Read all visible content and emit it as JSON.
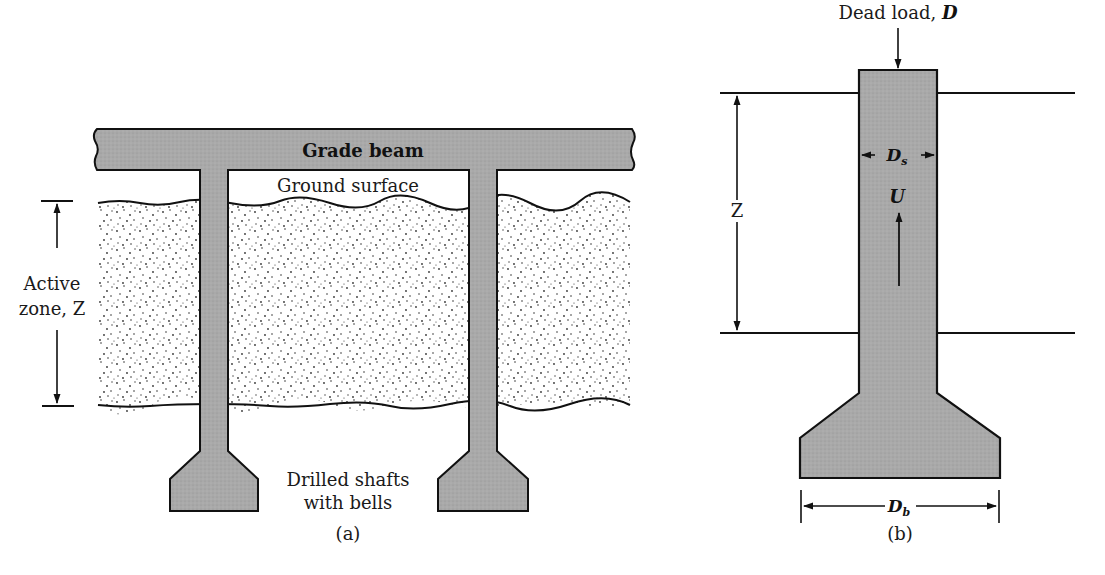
{
  "figure_a": {
    "caption": "(a)",
    "grade_beam_label": "Grade beam",
    "ground_surface_label": "Ground surface",
    "active_zone_label_line1": "Active",
    "active_zone_label_line2": "zone, Z",
    "shafts_label_line1": "Drilled shafts",
    "shafts_label_line2": "with bells"
  },
  "figure_b": {
    "caption": "(b)",
    "dead_load_label": "Dead load, ",
    "dead_load_symbol": "D",
    "zone_symbol": "Z",
    "shaft_diameter_symbol": "D",
    "shaft_diameter_subscript": "s",
    "uplift_symbol": "U",
    "bell_diameter_symbol": "D",
    "bell_diameter_subscript": "b"
  },
  "colors": {
    "concrete_fill": "#a9a9a9",
    "outline": "#111111",
    "soil_dots": "#333333",
    "background": "#ffffff"
  }
}
